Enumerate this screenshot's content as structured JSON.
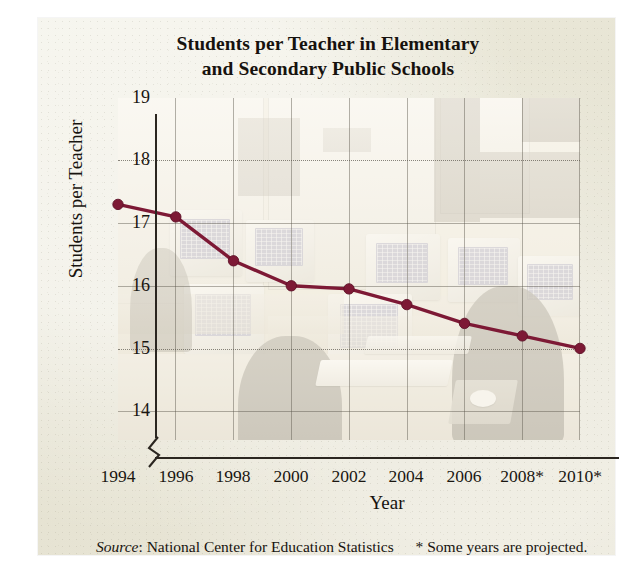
{
  "chart_data": {
    "type": "line",
    "title": "Students per Teacher in Elementary and Secondary Public Schools",
    "title_line1": "Students per Teacher in Elementary",
    "title_line2": "and Secondary Public Schools",
    "xlabel": "Year",
    "ylabel": "Students per Teacher",
    "x": [
      1994,
      1996,
      1998,
      2000,
      2002,
      2004,
      2006,
      2008,
      2010
    ],
    "xtick_labels": [
      "1994",
      "1996",
      "1998",
      "2000",
      "2002",
      "2004",
      "2006",
      "2008*",
      "2010*"
    ],
    "values": [
      17.3,
      17.1,
      16.4,
      16.0,
      15.95,
      15.7,
      15.4,
      15.2,
      15.0
    ],
    "ytick_labels": [
      "19",
      "18",
      "17",
      "16",
      "15",
      "14"
    ],
    "ytick_values": [
      19,
      18,
      17,
      16,
      15,
      14
    ],
    "ylim": [
      14,
      19
    ],
    "xlim": [
      1994,
      2010
    ],
    "y_axis_break": true,
    "grid": "both",
    "legend": "none",
    "series": [
      {
        "name": "Students per Teacher",
        "values": [
          17.3,
          17.1,
          16.4,
          16.0,
          15.95,
          15.7,
          15.4,
          15.2,
          15.0
        ],
        "color": "#7d1935",
        "marker": "circle"
      }
    ],
    "colors": {
      "line": "#7d1935",
      "marker": "#7d1935",
      "axis": "#2b2620",
      "grid": "#58544a",
      "panel_background": "#e7e4d4",
      "plot_background": "#f4f1e8",
      "text": "#17130f"
    },
    "annotations": [
      "* Some years are projected."
    ],
    "background_image_description": "faded photograph of a school computer lab with CRT monitors, keyboards, desks and chairs"
  },
  "source": {
    "label": "Source",
    "separator": ":",
    "text": "National Center for Education Statistics",
    "note": "* Some years are projected."
  }
}
